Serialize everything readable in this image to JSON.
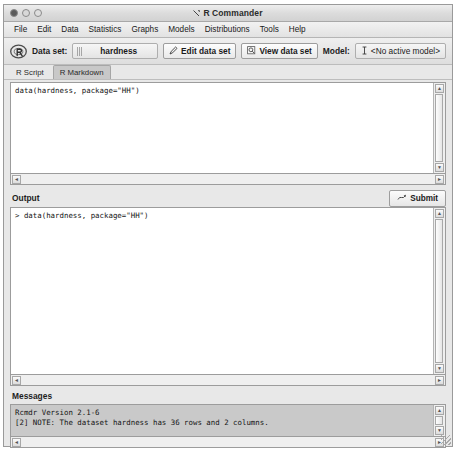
{
  "window": {
    "title": "R Commander",
    "title_icon": "r-commander-icon",
    "buttons": [
      {
        "name": "close",
        "label": ""
      },
      {
        "name": "minimize",
        "label": ""
      },
      {
        "name": "zoom",
        "label": ""
      }
    ]
  },
  "menubar": {
    "items": [
      {
        "label": "File"
      },
      {
        "label": "Edit"
      },
      {
        "label": "Data"
      },
      {
        "label": "Statistics"
      },
      {
        "label": "Graphs"
      },
      {
        "label": "Models"
      },
      {
        "label": "Distributions"
      },
      {
        "label": "Tools"
      },
      {
        "label": "Help"
      }
    ]
  },
  "toolbar": {
    "logo_icon": "r-logo-icon",
    "dataset_label": "Data set:",
    "dataset_value": "hardness",
    "edit_data_label": "Edit data set",
    "edit_data_icon": "pencil-icon",
    "view_data_label": "View data set",
    "view_data_icon": "magnifier-icon",
    "model_label": "Model:",
    "model_value": "<No active model>",
    "model_icon": "model-icon"
  },
  "tabs": [
    {
      "label": "R Script",
      "active": false
    },
    {
      "label": "R Markdown",
      "active": true
    }
  ],
  "script_pane": {
    "content": "data(hardness, package=\"HH\")"
  },
  "output_pane": {
    "header": "Output",
    "submit_label": "Submit",
    "submit_icon": "submit-icon",
    "content": "> data(hardness, package=\"HH\")"
  },
  "messages_pane": {
    "header": "Messages",
    "lines": [
      "Rcmdr Version 2.1-6",
      "[2] NOTE: The dataset hardness has 36 rows and 2 columns."
    ],
    "content": "Rcmdr Version 2.1-6\n[2] NOTE: The dataset hardness has 36 rows and 2 columns."
  },
  "scrollbars": {
    "up_arrow": "▲",
    "down_arrow": "▼",
    "left_arrow": "◄",
    "right_arrow": "►"
  },
  "colors": {
    "window_bg": "#e8e8e8",
    "pane_bg": "#ffffff",
    "messages_bg": "#c9c9c9",
    "border": "#9c9c9c",
    "tab_active": "#c8c8c8"
  }
}
